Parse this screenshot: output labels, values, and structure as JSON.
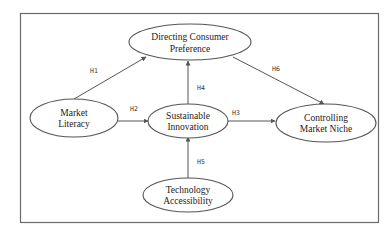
{
  "diagram": {
    "type": "conceptual-model",
    "colors": {
      "stroke": "#555555",
      "frame": "#6a6a6a",
      "text": "#222222",
      "background": "#ffffff"
    },
    "nodes": [
      {
        "id": "dcp",
        "line1": "Directing Consumer",
        "line2": "Preference"
      },
      {
        "id": "ml",
        "line1": "Market",
        "line2": "Literacy"
      },
      {
        "id": "si",
        "line1": "Sustainable",
        "line2": "Innovation"
      },
      {
        "id": "cmn",
        "line1": "Controlling",
        "line2": "Market Niche"
      },
      {
        "id": "ta",
        "line1": "Technology",
        "line2": "Accessibility"
      }
    ],
    "edges": [
      {
        "id": "h1",
        "label": "H1",
        "from": "Market Literacy",
        "to": "Directing Consumer Preference"
      },
      {
        "id": "h2",
        "label": "H2",
        "from": "Market Literacy",
        "to": "Sustainable Innovation"
      },
      {
        "id": "h3",
        "label": "H3",
        "from": "Sustainable Innovation",
        "to": "Controlling Market Niche"
      },
      {
        "id": "h4",
        "label": "H4",
        "from": "Sustainable Innovation",
        "to": "Directing Consumer Preference"
      },
      {
        "id": "h5",
        "label": "H5",
        "from": "Technology Accessibility",
        "to": "Sustainable Innovation"
      },
      {
        "id": "h6",
        "label": "H6",
        "from": "Directing Consumer Preference",
        "to": "Controlling Market Niche"
      }
    ]
  }
}
